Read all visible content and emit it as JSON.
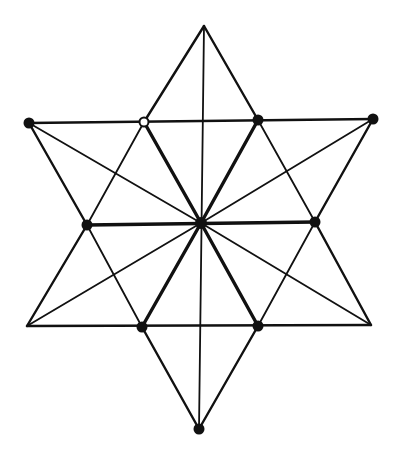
{
  "diagram": {
    "title": "",
    "points": {
      "top": {
        "label": "",
        "marker": "none"
      },
      "outer_upper_left": {
        "label": "",
        "marker": "filled"
      },
      "inner_upper_left": {
        "label": "",
        "marker": "hollow"
      },
      "inner_upper_right": {
        "label": "",
        "marker": "filled"
      },
      "outer_upper_right": {
        "label": "",
        "marker": "filled"
      },
      "mid_left": {
        "label": "",
        "marker": "filled"
      },
      "center": {
        "label": "",
        "marker": "filled"
      },
      "mid_right": {
        "label": "",
        "marker": "filled"
      },
      "outer_lower_left": {
        "label": "",
        "marker": "none"
      },
      "inner_lower_left": {
        "label": "",
        "marker": "filled"
      },
      "inner_lower_right": {
        "label": "",
        "marker": "filled"
      },
      "outer_lower_right": {
        "label": "",
        "marker": "none"
      },
      "bottom": {
        "label": "",
        "marker": "filled"
      }
    },
    "edges": [
      {
        "from": "top",
        "to": "inner_upper_left",
        "weight": "mid"
      },
      {
        "from": "top",
        "to": "inner_upper_right",
        "weight": "mid"
      },
      {
        "from": "top",
        "to": "bottom",
        "weight": "thin"
      },
      {
        "from": "outer_upper_left",
        "to": "outer_upper_right",
        "weight": "mid"
      },
      {
        "from": "outer_upper_left",
        "to": "mid_left",
        "weight": "mid"
      },
      {
        "from": "outer_upper_left",
        "to": "center",
        "weight": "thin"
      },
      {
        "from": "outer_upper_right",
        "to": "mid_right",
        "weight": "mid"
      },
      {
        "from": "outer_upper_right",
        "to": "center",
        "weight": "thin"
      },
      {
        "from": "inner_upper_left",
        "to": "mid_left",
        "weight": "thin"
      },
      {
        "from": "inner_upper_left",
        "to": "center",
        "weight": "thick"
      },
      {
        "from": "inner_upper_right",
        "to": "center",
        "weight": "thick"
      },
      {
        "from": "inner_upper_right",
        "to": "mid_right",
        "weight": "thin"
      },
      {
        "from": "mid_left",
        "to": "mid_right",
        "weight": "thick"
      },
      {
        "from": "mid_left",
        "to": "outer_lower_left",
        "weight": "mid"
      },
      {
        "from": "mid_left",
        "to": "inner_lower_left",
        "weight": "thin"
      },
      {
        "from": "mid_right",
        "to": "outer_lower_right",
        "weight": "mid"
      },
      {
        "from": "mid_right",
        "to": "inner_lower_right",
        "weight": "thin"
      },
      {
        "from": "center",
        "to": "outer_lower_left",
        "weight": "thin"
      },
      {
        "from": "center",
        "to": "outer_lower_right",
        "weight": "thin"
      },
      {
        "from": "center",
        "to": "inner_lower_left",
        "weight": "thick"
      },
      {
        "from": "center",
        "to": "inner_lower_right",
        "weight": "thick"
      },
      {
        "from": "outer_lower_left",
        "to": "outer_lower_right",
        "weight": "mid"
      },
      {
        "from": "inner_lower_left",
        "to": "bottom",
        "weight": "mid"
      },
      {
        "from": "inner_lower_right",
        "to": "bottom",
        "weight": "mid"
      }
    ]
  }
}
